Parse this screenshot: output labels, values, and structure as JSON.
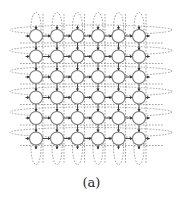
{
  "diagram": {
    "type": "2d-torus-mesh",
    "rows": 6,
    "cols": 6,
    "node_x": [
      36,
      57,
      77.5,
      98,
      118.5,
      139
    ],
    "node_y": [
      36,
      56.5,
      77,
      97.5,
      118,
      138.5
    ],
    "node_radius": 6.5,
    "colors": {
      "node_stroke": "#7a7a7a",
      "node_fill": "#ffffff",
      "edge": "#333333",
      "wrap": "#8a8a8a"
    },
    "wrap_links": {
      "horizontal_extent": [
        10,
        172
      ],
      "vertical_extent": [
        8,
        170
      ],
      "style": "dashed"
    }
  },
  "caption": "(a)"
}
